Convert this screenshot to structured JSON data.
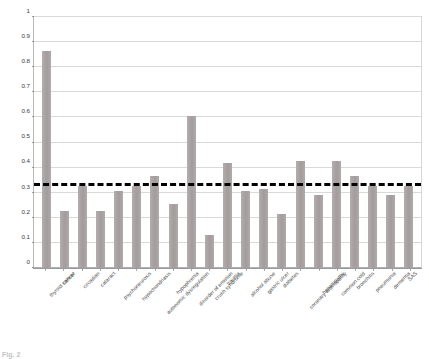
{
  "chart_data": {
    "type": "bar",
    "title": "",
    "xlabel": "",
    "ylabel": "",
    "ylim": [
      0,
      1
    ],
    "yticks": [
      "0",
      "0.1",
      "0.2",
      "0.3",
      "0.4",
      "0.5",
      "0.6",
      "0.7",
      "0.8",
      "0.9",
      "1"
    ],
    "ytick_values": [
      0,
      0.1,
      0.2,
      0.3,
      0.4,
      0.5,
      0.6,
      0.7,
      0.8,
      0.9,
      1
    ],
    "grid": true,
    "legend": "none",
    "bar_color": "#a8a2a2",
    "categories": [
      "thyroid cancer",
      "cancer",
      "circadian",
      "cataract",
      "psychoneurosis",
      "hypochondriasis",
      "autonomic dysregulation",
      "hypophrenia",
      "disorder of emotion",
      "crush syndrome",
      "trauma",
      "alcohol abuse",
      "gastric ulcer",
      "diabetes",
      "coronary arteriopathy",
      "hepatopathy",
      "common cold",
      "bronchitis",
      "pneumonia",
      "dementia",
      "SAS"
    ],
    "values": [
      0.865,
      0.228,
      0.328,
      0.227,
      0.305,
      0.327,
      0.365,
      0.255,
      0.605,
      0.13,
      0.42,
      0.305,
      0.315,
      0.215,
      0.425,
      0.29,
      0.425,
      0.365,
      0.325,
      0.29,
      0.325
    ],
    "annotations": [
      {
        "name": "threshold-line",
        "type": "horizontal-dashed-line",
        "value": 0.328,
        "color": "#000000",
        "style": "dashed",
        "width_px": 3
      }
    ]
  },
  "caption": {
    "prefix": "Fig. 2",
    "text": ""
  }
}
